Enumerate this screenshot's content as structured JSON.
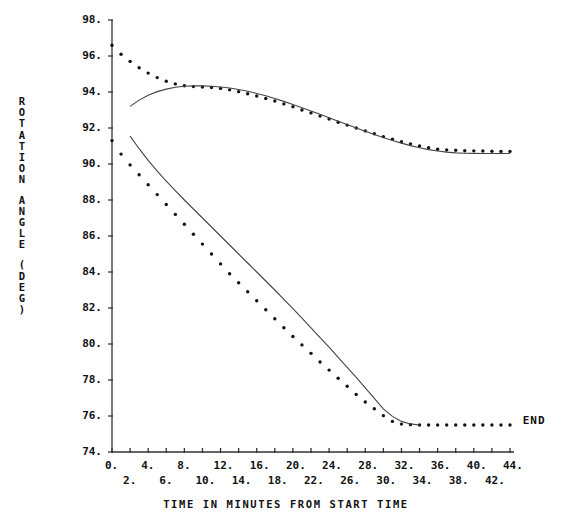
{
  "chart_data": {
    "type": "scatter",
    "title": "",
    "xlabel": "TIME IN MINUTES FROM START TIME",
    "ylabel": "ROTATION ANGLE (DEG)",
    "xlim": [
      0,
      44
    ],
    "ylim": [
      74,
      98
    ],
    "grid": false,
    "legend_position": "none",
    "x_tick_labels_row1": [
      "0.",
      "4.",
      "8.",
      "12.",
      "16.",
      "20.",
      "24.",
      "28.",
      "32.",
      "36.",
      "40.",
      "44."
    ],
    "x_tick_labels_row2": [
      "2.",
      "6.",
      "10.",
      "14.",
      "18.",
      "22.",
      "26.",
      "30.",
      "34.",
      "38.",
      "42."
    ],
    "x_tick_values_row1": [
      0,
      4,
      8,
      12,
      16,
      20,
      24,
      28,
      32,
      36,
      40,
      44
    ],
    "x_tick_values_row2": [
      2,
      6,
      10,
      14,
      18,
      22,
      26,
      30,
      34,
      38,
      42
    ],
    "y_tick_labels": [
      "98.",
      "96.",
      "94.",
      "92.",
      "90.",
      "88.",
      "86.",
      "84.",
      "82.",
      "80.",
      "78.",
      "76.",
      "74."
    ],
    "y_tick_values": [
      98,
      96,
      94,
      92,
      90,
      88,
      86,
      84,
      82,
      80,
      78,
      76,
      74
    ],
    "annotations": [
      {
        "text": "END",
        "x": 45.4,
        "y": 75.8
      }
    ],
    "series": [
      {
        "name": "upper-measured-points",
        "style": "dotted-points",
        "x": [
          0,
          1,
          2,
          3,
          4,
          5,
          6,
          7,
          8,
          9,
          10,
          11,
          12,
          13,
          14,
          15,
          16,
          17,
          18,
          19,
          20,
          21,
          22,
          23,
          24,
          25,
          26,
          27,
          28,
          29,
          30,
          31,
          32,
          33,
          34,
          35,
          36,
          37,
          38,
          39,
          40,
          41,
          42,
          43,
          44
        ],
        "y": [
          96.6,
          96.1,
          95.7,
          95.35,
          95.05,
          94.8,
          94.6,
          94.45,
          94.35,
          94.3,
          94.28,
          94.25,
          94.2,
          94.12,
          94.02,
          93.9,
          93.78,
          93.64,
          93.5,
          93.34,
          93.18,
          93.0,
          92.84,
          92.66,
          92.5,
          92.32,
          92.16,
          92.0,
          91.84,
          91.68,
          91.52,
          91.38,
          91.24,
          91.12,
          91.0,
          90.9,
          90.82,
          90.78,
          90.76,
          90.74,
          90.73,
          90.72,
          90.71,
          90.7,
          90.7
        ]
      },
      {
        "name": "upper-fitted-curve",
        "style": "line",
        "x": [
          2,
          3,
          4,
          5,
          6,
          7,
          8,
          9,
          10,
          11,
          12,
          13,
          14,
          15,
          16,
          17,
          18,
          19,
          20,
          21,
          22,
          23,
          24,
          25,
          26,
          27,
          28,
          29,
          30,
          31,
          32,
          33,
          34,
          35,
          36,
          37,
          38,
          39,
          40,
          41,
          42,
          43,
          44
        ],
        "y": [
          93.2,
          93.55,
          93.82,
          94.02,
          94.16,
          94.26,
          94.32,
          94.34,
          94.34,
          94.32,
          94.28,
          94.22,
          94.14,
          94.04,
          93.92,
          93.79,
          93.64,
          93.48,
          93.31,
          93.13,
          92.95,
          92.76,
          92.57,
          92.38,
          92.19,
          92.0,
          91.82,
          91.64,
          91.47,
          91.31,
          91.16,
          91.02,
          90.9,
          90.8,
          90.72,
          90.66,
          90.62,
          90.6,
          90.59,
          90.58,
          90.58,
          90.58,
          90.58
        ]
      },
      {
        "name": "lower-measured-points",
        "style": "dotted-points",
        "x": [
          0,
          1,
          2,
          3,
          4,
          5,
          6,
          7,
          8,
          9,
          10,
          11,
          12,
          13,
          14,
          15,
          16,
          17,
          18,
          19,
          20,
          21,
          22,
          23,
          24,
          25,
          26,
          27,
          28,
          29,
          30,
          31,
          32,
          33,
          34,
          35,
          36,
          37,
          38,
          39,
          40,
          41,
          42,
          43,
          44
        ],
        "y": [
          91.3,
          90.55,
          89.95,
          89.4,
          88.85,
          88.3,
          87.75,
          87.2,
          86.65,
          86.1,
          85.55,
          85.0,
          84.45,
          83.9,
          83.4,
          82.9,
          82.4,
          81.9,
          81.4,
          80.9,
          80.42,
          79.95,
          79.48,
          79.0,
          78.55,
          78.1,
          77.65,
          77.2,
          76.78,
          76.4,
          76.02,
          75.7,
          75.55,
          75.52,
          75.5,
          75.5,
          75.5,
          75.5,
          75.5,
          75.5,
          75.5,
          75.5,
          75.5,
          75.5,
          75.5
        ]
      },
      {
        "name": "lower-fitted-curve",
        "style": "line",
        "x": [
          2,
          3,
          4,
          5,
          6,
          7,
          8,
          9,
          10,
          11,
          12,
          13,
          14,
          15,
          16,
          17,
          18,
          19,
          20,
          21,
          22,
          23,
          24,
          25,
          26,
          27,
          28,
          29,
          30,
          31,
          32,
          33,
          34
        ],
        "y": [
          91.55,
          90.85,
          90.2,
          89.6,
          89.05,
          88.52,
          88.0,
          87.5,
          87.0,
          86.5,
          86.0,
          85.5,
          85.0,
          84.5,
          84.0,
          83.5,
          83.0,
          82.48,
          81.96,
          81.44,
          80.9,
          80.36,
          79.82,
          79.26,
          78.7,
          78.14,
          77.56,
          76.98,
          76.4,
          75.98,
          75.7,
          75.56,
          75.5
        ]
      }
    ]
  }
}
